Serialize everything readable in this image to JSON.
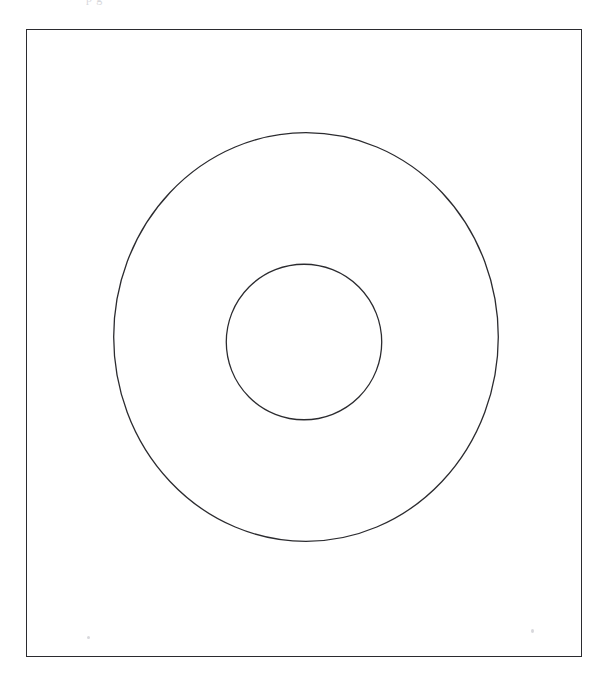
{
  "page": {
    "width": 607,
    "height": 680,
    "background_color": "#ffffff",
    "header_text": "p       g",
    "ink_color": "#2b2b2f",
    "speck_color": "#c9c9cf"
  },
  "frame": {
    "label": "figure-border",
    "x": 26,
    "y": 29,
    "width": 556,
    "height": 628,
    "stroke_color": "#2b2b2f",
    "stroke_width": 1.4,
    "fill": "none"
  },
  "chart_data": {
    "type": "diagram",
    "title": "",
    "subtitle": "",
    "xlabel": "",
    "ylabel": "",
    "grid": false,
    "legend": null,
    "view_box": {
      "x": 0,
      "y": 0,
      "width": 556,
      "height": 628
    },
    "shapes": [
      {
        "name": "outer-circle",
        "type": "ellipse",
        "cx": 280,
        "cy": 308,
        "rx": 193,
        "ry": 205,
        "stroke_color": "#2b2b2f",
        "stroke_width": 1.3,
        "fill": "none"
      },
      {
        "name": "inner-circle",
        "type": "ellipse",
        "cx": 278,
        "cy": 313,
        "rx": 78,
        "ry": 78,
        "stroke_color": "#2b2b2f",
        "stroke_width": 1.3,
        "fill": "none"
      }
    ],
    "annotations": []
  },
  "artifacts": [
    {
      "name": "dust-speck-left",
      "x": 87,
      "y": 636,
      "width": 3,
      "height": 3
    },
    {
      "name": "dust-speck-right",
      "x": 531,
      "y": 629,
      "width": 3,
      "height": 4
    }
  ]
}
